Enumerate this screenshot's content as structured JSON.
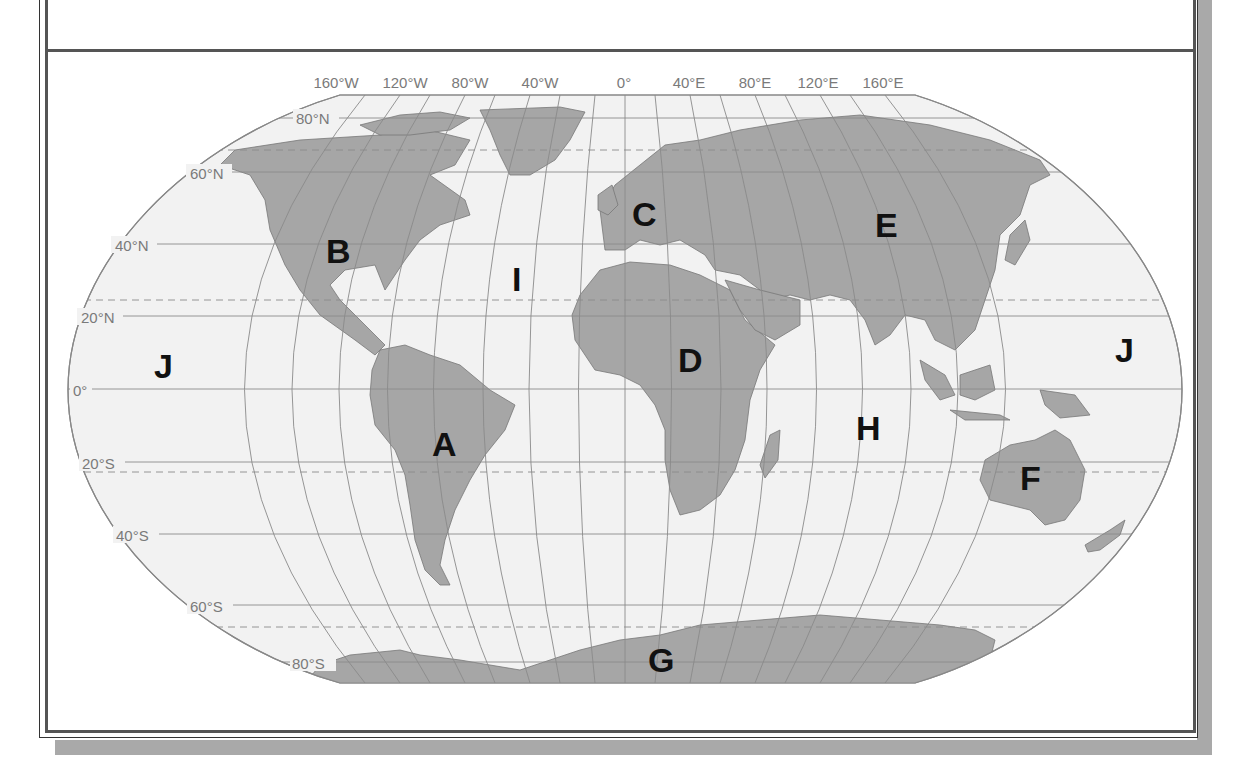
{
  "map": {
    "projection": "Robinson",
    "colors": {
      "ocean": "#f2f2f2",
      "land": "#a6a6a6",
      "coastline": "#777777",
      "graticule": "#8a8a8a",
      "label": "#111111",
      "frame": "#555555",
      "shadow": "#a9a9a9"
    },
    "longitude_labels": [
      "160°W",
      "120°W",
      "80°W",
      "40°W",
      "0°",
      "40°E",
      "80°E",
      "120°E",
      "160°E"
    ],
    "latitude_labels": [
      "80°N",
      "60°N",
      "40°N",
      "20°N",
      "0°",
      "20°S",
      "40°S",
      "60°S",
      "80°S"
    ],
    "region_labels": [
      {
        "id": "A",
        "label": "A",
        "feature": "South America"
      },
      {
        "id": "B",
        "label": "B",
        "feature": "North America"
      },
      {
        "id": "C",
        "label": "C",
        "feature": "Europe"
      },
      {
        "id": "D",
        "label": "D",
        "feature": "Africa"
      },
      {
        "id": "E",
        "label": "E",
        "feature": "Asia"
      },
      {
        "id": "F",
        "label": "F",
        "feature": "Australia"
      },
      {
        "id": "G",
        "label": "G",
        "feature": "Antarctica"
      },
      {
        "id": "H",
        "label": "H",
        "feature": "Indian Ocean"
      },
      {
        "id": "I",
        "label": "I",
        "feature": "Atlantic Ocean"
      },
      {
        "id": "J1",
        "label": "J",
        "feature": "Pacific Ocean (east)"
      },
      {
        "id": "J2",
        "label": "J",
        "feature": "Pacific Ocean (west)"
      }
    ]
  }
}
